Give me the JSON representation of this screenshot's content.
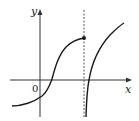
{
  "figure": {
    "labels": {
      "y_axis": "y",
      "x_axis": "x",
      "origin": "0"
    },
    "colors": {
      "curve": "#1a1a1a",
      "axis": "#333333",
      "asymptote": "#555555",
      "background": "#ffffff"
    },
    "elements": {
      "closed_point": {
        "x": 84,
        "y": 38,
        "filled": true
      },
      "asymptote_x": 84
    }
  }
}
